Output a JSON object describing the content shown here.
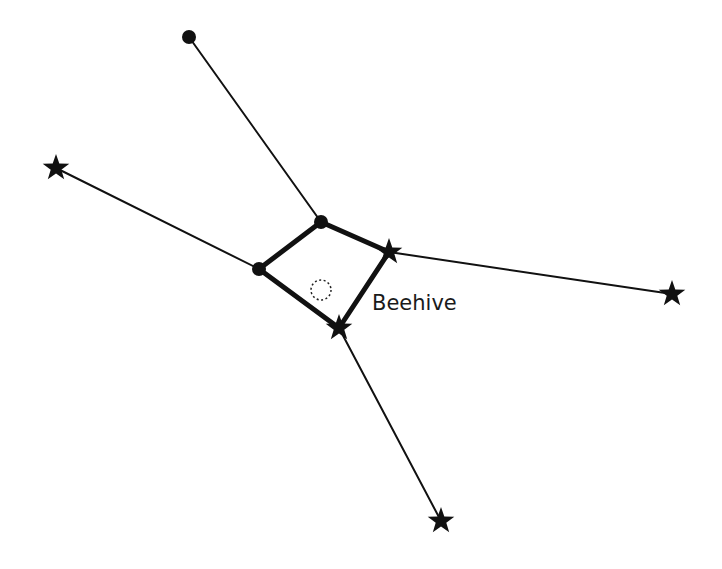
{
  "diagram": {
    "title": "",
    "label": "Beehive",
    "colors": {
      "line": "#111111",
      "background": "#ffffff"
    },
    "nodes": [
      {
        "id": "n1",
        "type": "dot",
        "x": 189,
        "y": 37
      },
      {
        "id": "n2",
        "type": "dot",
        "x": 321,
        "y": 222
      },
      {
        "id": "n3",
        "type": "dot",
        "x": 259,
        "y": 269
      },
      {
        "id": "s1",
        "type": "star",
        "x": 56,
        "y": 168
      },
      {
        "id": "s2",
        "type": "star",
        "x": 389,
        "y": 252
      },
      {
        "id": "s3",
        "type": "star",
        "x": 672,
        "y": 294
      },
      {
        "id": "s4",
        "type": "star",
        "x": 339,
        "y": 328
      },
      {
        "id": "s5",
        "type": "star",
        "x": 441,
        "y": 521
      }
    ],
    "cluster": {
      "name": "Beehive",
      "x": 321,
      "y": 290,
      "r": 10
    }
  }
}
